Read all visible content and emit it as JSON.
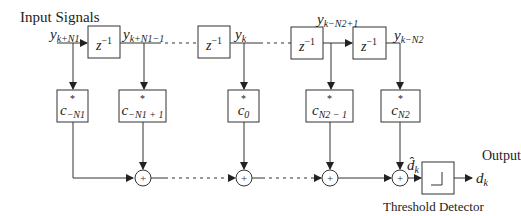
{
  "diagram": {
    "type": "block-diagram",
    "title": "Input Signals",
    "output_label": "Output",
    "detector_label": "Threshold Detector",
    "signals": {
      "y_in": {
        "base": "y",
        "sub": "k+N1"
      },
      "y_1": {
        "base": "y",
        "sub": "k+N1−1"
      },
      "y_k": {
        "base": "y",
        "sub": "k"
      },
      "y_n2p1": {
        "base": "y",
        "sub": "k−N2+1"
      },
      "y_n2": {
        "base": "y",
        "sub": "k−N2"
      },
      "d_hat": {
        "base": "d̂",
        "sub": "k"
      },
      "d_out": {
        "base": "d",
        "sub": "k"
      }
    },
    "delays": [
      {
        "id": "delay-1",
        "base": "z",
        "sup": "−1"
      },
      {
        "id": "delay-2",
        "base": "z",
        "sup": "−1"
      },
      {
        "id": "delay-3",
        "base": "z",
        "sup": "−1"
      },
      {
        "id": "delay-4",
        "base": "z",
        "sup": "−1"
      }
    ],
    "coefficients": [
      {
        "id": "coef-minus-n1",
        "star": "*",
        "base": "c",
        "sub": "−N1"
      },
      {
        "id": "coef-minus-n1-plus-1",
        "star": "*",
        "base": "c",
        "sub": "−N1 + 1"
      },
      {
        "id": "coef-0",
        "star": "*",
        "base": "c",
        "sub": "0"
      },
      {
        "id": "coef-n2-minus-1",
        "star": "*",
        "base": "c",
        "sub": "N2 − 1"
      },
      {
        "id": "coef-n2",
        "star": "*",
        "base": "c",
        "sub": "N2"
      }
    ],
    "summers": [
      {
        "id": "sum-1",
        "symbol": "+"
      },
      {
        "id": "sum-2",
        "symbol": "+"
      },
      {
        "id": "sum-3",
        "symbol": "+"
      },
      {
        "id": "sum-4",
        "symbol": "+"
      }
    ],
    "colors": {
      "stroke": "#333333",
      "background": "#ffffff"
    }
  }
}
